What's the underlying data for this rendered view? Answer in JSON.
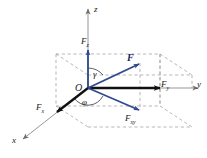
{
  "figure": {
    "kind": "vector-decomposition-3d",
    "background_color": "#ffffff",
    "colors": {
      "vector_blue": "#2f4a8c",
      "vector_dark_blue": "#16205a",
      "component_black": "#111111",
      "axis_gray": "#8a8a8a",
      "dashed_gray": "#9a9a9a"
    }
  },
  "axes": {
    "z": {
      "label": "z"
    },
    "y": {
      "label": "y"
    },
    "x": {
      "label": "x"
    }
  },
  "origin": {
    "label": "O"
  },
  "vectors": {
    "resultant": {
      "label": "F",
      "sub": ""
    },
    "z_component": {
      "label": "F",
      "sub": "z"
    },
    "y_component": {
      "label": "F",
      "sub": "y"
    },
    "x_component": {
      "label": "F",
      "sub": "x"
    },
    "xy_projection": {
      "label": "F",
      "sub": "xy"
    }
  },
  "angles": {
    "gamma": {
      "label": "γ"
    },
    "phi": {
      "label": "φ"
    }
  }
}
